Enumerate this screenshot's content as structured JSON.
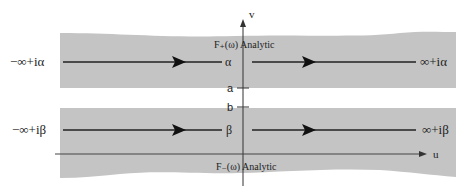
{
  "diagram": {
    "axes": {
      "vertical_label": "v",
      "horizontal_label": "u"
    },
    "upper_strip": {
      "fill_color": "#c4c4c4",
      "region_label": "F₊(ω) Analytic",
      "contour_left": "−∞+iα",
      "contour_right": "∞+iα",
      "axis_mark": "α",
      "bound_label": "a"
    },
    "lower_strip": {
      "fill_color": "#c4c4c4",
      "region_label": "F₋(ω) Analytic",
      "contour_left": "−∞+iβ",
      "contour_right": "∞+iβ",
      "axis_mark": "β",
      "bound_label": "b"
    }
  }
}
